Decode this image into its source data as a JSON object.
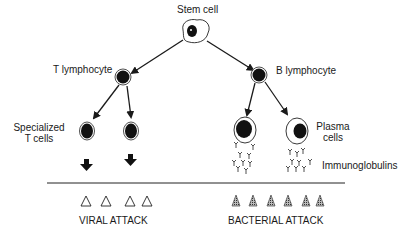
{
  "diagram": {
    "title": "",
    "nodes": {
      "stem_cell": "Stem cell",
      "t_lymphocyte": "T lymphocyte",
      "b_lymphocyte": "B lymphocyte",
      "specialized_t_cells_line1": "Specialized",
      "specialized_t_cells_line2": "T cells",
      "plasma_cells_line1": "Plasma",
      "plasma_cells_line2": "cells",
      "immunoglobulins": "Immunoglobulins"
    },
    "bottom_labels": {
      "viral": "VIRAL ATTACK",
      "bacterial": "BACTERIAL ATTACK"
    },
    "edges": [
      {
        "from": "Stem cell",
        "to": "T lymphocyte"
      },
      {
        "from": "Stem cell",
        "to": "B lymphocyte"
      },
      {
        "from": "T lymphocyte",
        "to": "Specialized T cell 1"
      },
      {
        "from": "T lymphocyte",
        "to": "Specialized T cell 2"
      },
      {
        "from": "B lymphocyte",
        "to": "Plasma cell 1"
      },
      {
        "from": "B lymphocyte",
        "to": "Plasma cell 2"
      }
    ],
    "viral_particles": 4,
    "bacteria": 6
  }
}
